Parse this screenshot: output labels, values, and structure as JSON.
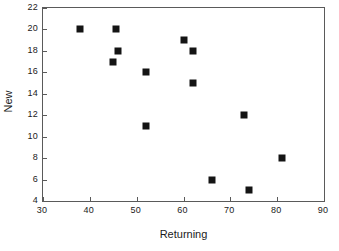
{
  "chart_data": {
    "type": "scatter",
    "title": "",
    "xlabel": "Returning",
    "ylabel": "New",
    "xlim": [
      30,
      90
    ],
    "ylim": [
      4,
      22
    ],
    "xticks": [
      30,
      40,
      50,
      60,
      70,
      80,
      90
    ],
    "yticks": [
      4,
      6,
      8,
      10,
      12,
      14,
      16,
      18,
      20,
      22
    ],
    "grid": false,
    "legend": false,
    "marker": {
      "shape": "square",
      "color": "#141414",
      "size_px": 7
    },
    "series": [
      {
        "name": "data",
        "points": [
          {
            "x": 38,
            "y": 20
          },
          {
            "x": 45,
            "y": 17
          },
          {
            "x": 45.5,
            "y": 20
          },
          {
            "x": 46,
            "y": 18
          },
          {
            "x": 52,
            "y": 16
          },
          {
            "x": 52,
            "y": 11
          },
          {
            "x": 60,
            "y": 19
          },
          {
            "x": 62,
            "y": 18
          },
          {
            "x": 62,
            "y": 15
          },
          {
            "x": 66,
            "y": 6
          },
          {
            "x": 73,
            "y": 12
          },
          {
            "x": 74,
            "y": 5
          },
          {
            "x": 81,
            "y": 8
          }
        ]
      }
    ]
  }
}
